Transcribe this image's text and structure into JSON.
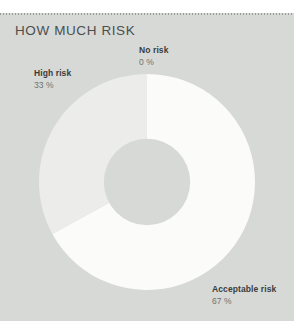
{
  "card": {
    "title": "HOW MUCH RISK",
    "background_color": "#d7d9d7",
    "title_color": "#4c4f4d"
  },
  "chart_data": {
    "type": "pie",
    "variant": "donut",
    "title": "HOW MUCH RISK",
    "xlabel": "",
    "ylabel": "",
    "legend_position": "none",
    "grid": false,
    "total": 100,
    "unit": "%",
    "start_angle_deg": 0,
    "direction": "clockwise",
    "inner_radius_ratio": 0.4,
    "categories": [
      "No risk",
      "Acceptable risk",
      "High risk"
    ],
    "values": [
      0,
      67,
      33
    ],
    "colors": [
      "#f7f8f7",
      "#fbfbfa",
      "#ecedeb"
    ],
    "slices": [
      {
        "name": "No risk",
        "value": 0,
        "value_text": "0 %",
        "color": "#f7f8f7",
        "start_deg": 0,
        "end_deg": 0
      },
      {
        "name": "Acceptable risk",
        "value": 67,
        "value_text": "67 %",
        "color": "#fbfbfa",
        "start_deg": 0,
        "end_deg": 241.2
      },
      {
        "name": "High risk",
        "value": 33,
        "value_text": "33 %",
        "color": "#ecedeb",
        "start_deg": 241.2,
        "end_deg": 360
      }
    ],
    "annotations": [
      {
        "name": "No risk",
        "value_text": "0 %"
      },
      {
        "name": "High risk",
        "value_text": "33 %"
      },
      {
        "name": "Acceptable risk",
        "value_text": "67 %"
      }
    ]
  }
}
